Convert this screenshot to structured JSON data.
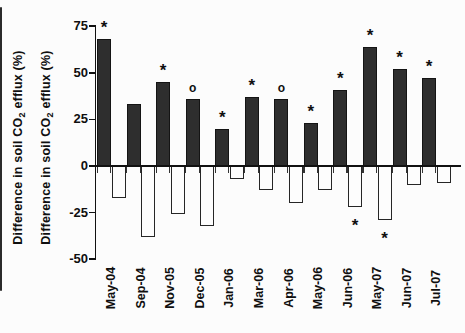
{
  "figure": {
    "background": "#fcfcfc",
    "bar_fill": "#2e2e2e",
    "bar_outline": "#141414",
    "open_bar_fill": "#fdfdfd",
    "axis_color": "#111111",
    "text_color": "#0f0f0f"
  },
  "y_axis": {
    "title": {
      "prefix": "Difference in soil CO",
      "subscript": "2",
      "suffix": " efflux (%)"
    },
    "title_instances": 2,
    "tick_labels": [
      "75",
      "50",
      "25",
      "0",
      "-25",
      "-50"
    ]
  },
  "chart_data": {
    "type": "bar",
    "title": "",
    "xlabel": "",
    "ylabel": "Difference in soil CO2 efflux (%)",
    "ylim": [
      -50,
      75
    ],
    "yticks": [
      75,
      50,
      25,
      0,
      -25,
      -50
    ],
    "grid": false,
    "legend": null,
    "categories": [
      "May-04",
      "Sep-04",
      "Nov-05",
      "Dec-05",
      "Jan-06",
      "Mar-06",
      "Apr-06",
      "May-06",
      "Jun-06",
      "May-07",
      "Jun-07",
      "Jul-07"
    ],
    "series": [
      {
        "name": "filled bars (positive difference)",
        "style": "solid-dark",
        "values": [
          68,
          33,
          45,
          36,
          20,
          37,
          36,
          23,
          41,
          64,
          52,
          47
        ]
      },
      {
        "name": "open bars (negative difference)",
        "style": "open-white",
        "values": [
          -17,
          -38,
          -26,
          -32,
          -7,
          -13,
          -20,
          -13,
          -22,
          -29,
          -10,
          -9
        ]
      }
    ],
    "significance_above": [
      "*",
      "",
      "*",
      "o",
      "*",
      "*",
      "o",
      "*",
      "*",
      "*",
      "*",
      "*"
    ],
    "significance_below": [
      "",
      "",
      "",
      "",
      "",
      "",
      "",
      "",
      "*",
      "*",
      "",
      ""
    ]
  }
}
